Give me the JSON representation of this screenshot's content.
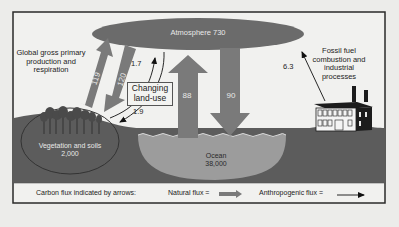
{
  "diagram": {
    "atmosphere": {
      "label": "Atmosphere 730"
    },
    "vegetation": {
      "label": "Vegetation and soils",
      "value": "2,000"
    },
    "ocean": {
      "label": "Ocean",
      "value": "38,000"
    },
    "gpp": {
      "label_line1": "Global gross primary",
      "label_line2": "production and",
      "label_line3": "respiration"
    },
    "land_use": {
      "label_line1": "Changing",
      "label_line2": "land-use"
    },
    "fossil": {
      "label_line1": "Fossil fuel",
      "label_line2": "combustion and",
      "label_line3": "industrial",
      "label_line4": "processes"
    },
    "fluxes": {
      "veg_to_atm": "119",
      "atm_to_veg": "120",
      "ocean_to_atm": "88",
      "atm_to_ocean": "90",
      "landuse_up": "1.7",
      "landuse_down": "1.9",
      "fossil_up": "6.3"
    },
    "colors": {
      "atmosphere": "#6b6b6b",
      "ground": "#5c5c5c",
      "ocean": "#9a9a9a",
      "natural_arrow": "#7a7a7a",
      "frame": "#2a2a2a",
      "background": "#ececea"
    }
  },
  "legend": {
    "title": "Carbon flux indicated by arrows:",
    "natural": "Natural flux =",
    "anthropogenic": "Anthropogenic flux ="
  }
}
